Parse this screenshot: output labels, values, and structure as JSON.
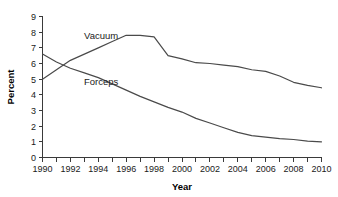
{
  "chart_data": {
    "type": "line",
    "title": "",
    "xlabel": "Year",
    "ylabel": "Percent",
    "xlim": [
      1990,
      2010
    ],
    "ylim": [
      0,
      9
    ],
    "ytick_step": 1,
    "xtick_step": 1,
    "xtick_label_step": 2,
    "grid": false,
    "legend": "inline-labels",
    "x": [
      1990,
      1991,
      1992,
      1993,
      1994,
      1995,
      1996,
      1997,
      1998,
      1999,
      2000,
      2001,
      2002,
      2003,
      2004,
      2005,
      2006,
      2007,
      2008,
      2009,
      2010
    ],
    "series": [
      {
        "name": "Vacuum",
        "label": "Vacuum",
        "color": "#4a4a4a",
        "values": [
          5.0,
          5.6,
          6.2,
          6.6,
          7.0,
          7.4,
          7.8,
          7.8,
          7.7,
          6.5,
          6.3,
          6.05,
          6.0,
          5.9,
          5.8,
          5.6,
          5.5,
          5.2,
          4.8,
          4.6,
          4.45
        ]
      },
      {
        "name": "Forceps",
        "label": "Forceps",
        "color": "#4a4a4a",
        "values": [
          6.6,
          6.1,
          5.7,
          5.4,
          5.1,
          4.7,
          4.3,
          3.9,
          3.55,
          3.2,
          2.9,
          2.5,
          2.2,
          1.9,
          1.6,
          1.4,
          1.3,
          1.2,
          1.15,
          1.05,
          1.0
        ]
      }
    ],
    "ytick_labels": [
      "0",
      "1",
      "2",
      "3",
      "4",
      "5",
      "6",
      "7",
      "8",
      "9"
    ],
    "xtick_labels": [
      "1990",
      "1992",
      "1994",
      "1996",
      "1998",
      "2000",
      "2002",
      "2004",
      "2006",
      "2008",
      "2010"
    ],
    "annotations": [
      {
        "text": "Vacuum",
        "x": 1994.2,
        "y": 7.55
      },
      {
        "text": "Forceps",
        "x": 1994.2,
        "y": 4.62
      }
    ],
    "colors": {
      "axis": "#3a3a3a",
      "line": "#4a4a4a",
      "text": "#1a1a1a",
      "background": "#ffffff"
    }
  }
}
